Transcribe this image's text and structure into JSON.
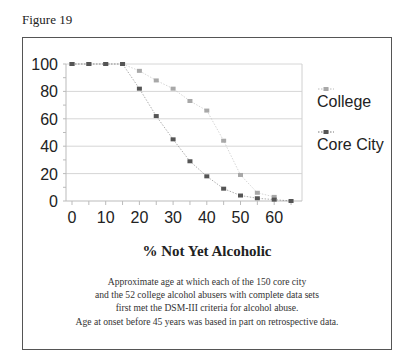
{
  "figure_label": "Figure 19",
  "chart_data": {
    "type": "line",
    "title": "% Not Yet Alcoholic",
    "xlabel": "",
    "ylabel": "",
    "x": [
      0,
      5,
      10,
      15,
      20,
      25,
      30,
      35,
      40,
      45,
      50,
      55,
      60,
      65
    ],
    "series": [
      {
        "name": "College",
        "color": "#a8a8a8",
        "values": [
          100,
          100,
          100,
          100,
          95,
          88,
          82,
          73,
          66,
          44,
          19,
          6,
          3,
          null
        ]
      },
      {
        "name": "Core City",
        "color": "#555555",
        "values": [
          100,
          100,
          100,
          100,
          82,
          62,
          45,
          29,
          18,
          9,
          4,
          2,
          1,
          0
        ]
      }
    ],
    "x_ticks": [
      0,
      10,
      20,
      30,
      40,
      50,
      60
    ],
    "y_ticks": [
      0,
      20,
      40,
      60,
      80,
      100
    ],
    "xlim": [
      0,
      65
    ],
    "ylim": [
      0,
      100
    ],
    "grid": "horizontal",
    "legend_position": "right"
  },
  "caption": {
    "title": "% Not Yet Alcoholic",
    "lines": [
      "Approximate age at which each of the 150 core city",
      "and the 52 college alcohol abusers with complete data sets",
      "first met the DSM-III criteria for alcohol abuse.",
      "Age at onset before 45 years was based in part on retrospective data."
    ]
  }
}
